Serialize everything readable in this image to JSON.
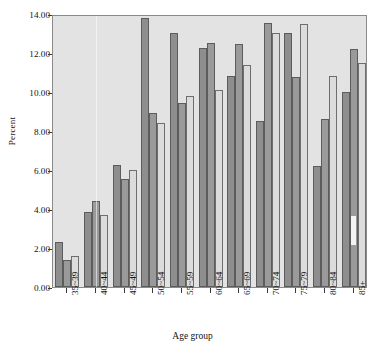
{
  "chart_data": {
    "type": "bar",
    "title": "",
    "subtitle": "",
    "xlabel": "Age group",
    "ylabel": "Percent",
    "categories": [
      "35~39",
      "40~44",
      "45~49",
      "50~54",
      "55~59",
      "60~64",
      "65~69",
      "70~74",
      "75~79",
      "80~84",
      "85+"
    ],
    "series": [
      {
        "name": "series-1",
        "color": "#8e8e8e",
        "values": [
          2.3,
          3.85,
          6.25,
          13.8,
          13.05,
          12.25,
          10.8,
          8.5,
          13.05,
          6.2,
          10.0
        ]
      },
      {
        "name": "series-2",
        "color": "#9a9a9a",
        "values": [
          1.4,
          4.4,
          5.55,
          8.9,
          9.45,
          12.5,
          12.45,
          13.55,
          10.75,
          8.6,
          12.2
        ]
      },
      {
        "name": "series-3",
        "color": "#dcdcdc",
        "values": [
          1.6,
          3.7,
          6.0,
          8.4,
          9.8,
          10.1,
          11.4,
          13.05,
          13.5,
          10.8,
          11.5
        ]
      }
    ],
    "ylim": [
      0.0,
      14.0
    ],
    "ytick_step": 2.0,
    "ytick_labels": [
      "0.00",
      "2.00",
      "4.00",
      "6.00",
      "8.00",
      "10.00",
      "12.00",
      "14.00"
    ],
    "grid": false,
    "legend": "none",
    "plot_background": "#e3e3e3",
    "axis_color": "#8a8a8a",
    "annotations": []
  }
}
